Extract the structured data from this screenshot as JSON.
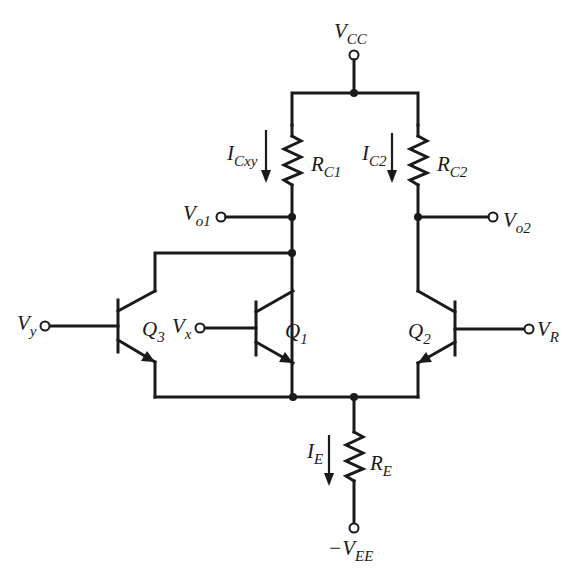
{
  "diagram": {
    "type": "circuit-schematic",
    "title": "",
    "supply_top": {
      "symbol": "V",
      "sub": "CC"
    },
    "supply_bottom": {
      "prefix": "−",
      "symbol": "V",
      "sub": "EE"
    },
    "resistors": [
      {
        "id": "RC1",
        "symbol": "R",
        "sub": "C1"
      },
      {
        "id": "RC2",
        "symbol": "R",
        "sub": "C2"
      },
      {
        "id": "RE",
        "symbol": "R",
        "sub": "E"
      }
    ],
    "currents": [
      {
        "id": "ICxy",
        "symbol": "I",
        "sub": "Cxy",
        "direction": "down"
      },
      {
        "id": "IC2",
        "symbol": "I",
        "sub": "C2",
        "direction": "down"
      },
      {
        "id": "IE",
        "symbol": "I",
        "sub": "E",
        "direction": "down"
      }
    ],
    "transistors": [
      {
        "id": "Q3",
        "symbol": "Q",
        "sub": "3",
        "type": "npn",
        "base_input": {
          "symbol": "V",
          "sub": "y"
        }
      },
      {
        "id": "Q1",
        "symbol": "Q",
        "sub": "1",
        "type": "npn",
        "base_input": {
          "symbol": "V",
          "sub": "x"
        }
      },
      {
        "id": "Q2",
        "symbol": "Q",
        "sub": "2",
        "type": "npn",
        "base_input": {
          "symbol": "V",
          "sub": "R"
        }
      }
    ],
    "outputs": [
      {
        "id": "Vo1",
        "symbol": "V",
        "sub": "o1"
      },
      {
        "id": "Vo2",
        "symbol": "V",
        "sub": "o2"
      }
    ]
  }
}
